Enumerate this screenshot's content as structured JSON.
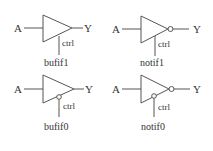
{
  "diagram": {
    "title": "",
    "colors": {
      "stroke": "#555555",
      "text": "#333333",
      "background": "#ffffff"
    },
    "gates": [
      {
        "name": "bufif1",
        "input": "A",
        "output": "Y",
        "control": "ctrl",
        "output_inverted": false,
        "control_inverted": false
      },
      {
        "name": "notif1",
        "input": "A",
        "output": "Y",
        "control": "ctrl",
        "output_inverted": true,
        "control_inverted": false
      },
      {
        "name": "bufif0",
        "input": "A",
        "output": "Y",
        "control": "ctrl",
        "output_inverted": false,
        "control_inverted": true
      },
      {
        "name": "notif0",
        "input": "A",
        "output": "Y",
        "control": "ctrl",
        "output_inverted": true,
        "control_inverted": true
      }
    ]
  }
}
